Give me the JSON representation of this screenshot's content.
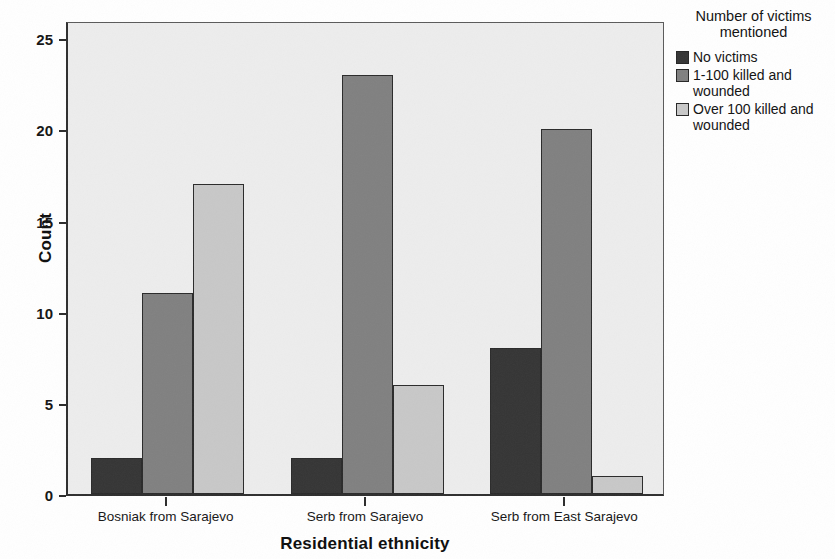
{
  "chart_data": {
    "type": "bar",
    "title": "",
    "xlabel": "Residential ethnicity",
    "ylabel": "Count",
    "categories": [
      "Bosniak from Sarajevo",
      "Serb from Sarajevo",
      "Serb from East Sarajevo"
    ],
    "series": [
      {
        "name": "No victims",
        "values": [
          2,
          2,
          8
        ],
        "color": "#353535"
      },
      {
        "name": "1-100 killed and wounded",
        "values": [
          11,
          23,
          20
        ],
        "color": "#808080"
      },
      {
        "name": "Over 100 killed and wounded",
        "values": [
          17,
          6,
          1
        ],
        "color": "#c8c8c8"
      }
    ],
    "ylim": [
      0,
      26
    ],
    "yticks": [
      0,
      5,
      10,
      15,
      20,
      25
    ],
    "ytick_labels": [
      "0",
      "5",
      "10",
      "15",
      "20",
      "25"
    ],
    "grid": false,
    "legend": {
      "position": "right",
      "title_line1": "Number of victims",
      "title_line2": "mentioned",
      "entries": [
        {
          "label": "No victims",
          "color": "#353535"
        },
        {
          "label": "1-100 killed and wounded",
          "color": "#808080"
        },
        {
          "label": "Over 100 killed and wounded",
          "color": "#c8c8c8"
        }
      ]
    },
    "plot_background": "#ededed",
    "axis_color": "#2e2e2e"
  }
}
